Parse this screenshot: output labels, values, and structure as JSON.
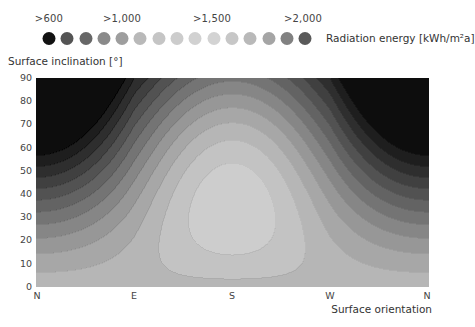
{
  "legend": {
    "title": "Radiation energy [kWh/m²a]",
    "labels": [
      {
        "text": ">600",
        "x": 49
      },
      {
        "text": ">1,000",
        "x": 122
      },
      {
        "text": ">1,500",
        "x": 212
      },
      {
        "text": ">2,000",
        "x": 303
      }
    ],
    "dots": [
      {
        "value": 600,
        "color": "#121212",
        "x": 49
      },
      {
        "value": 700,
        "color": "#545454",
        "x": 67
      },
      {
        "value": 800,
        "color": "#676767",
        "x": 86
      },
      {
        "value": 900,
        "color": "#8a8a8a",
        "x": 104
      },
      {
        "value": 1000,
        "color": "#9e9e9e",
        "x": 122
      },
      {
        "value": 1100,
        "color": "#b9b9b9",
        "x": 140
      },
      {
        "value": 1200,
        "color": "#c5c5c5",
        "x": 159
      },
      {
        "value": 1300,
        "color": "#cccccc",
        "x": 177
      },
      {
        "value": 1400,
        "color": "#d1d1d1",
        "x": 195
      },
      {
        "value": 1500,
        "color": "#d3d3d3",
        "x": 214
      },
      {
        "value": 1600,
        "color": "#c7c7c7",
        "x": 232
      },
      {
        "value": 1700,
        "color": "#b9b9b9",
        "x": 250
      },
      {
        "value": 1800,
        "color": "#a5a5a5",
        "x": 269
      },
      {
        "value": 1900,
        "color": "#818181",
        "x": 287
      },
      {
        "value": 2000,
        "color": "#5a5a5a",
        "x": 305
      }
    ]
  },
  "axes": {
    "ylabel": "Surface inclination [°]",
    "xlabel": "Surface orientation",
    "yticks": [
      {
        "text": "90",
        "y": 78
      },
      {
        "text": "80",
        "y": 101
      },
      {
        "text": "70",
        "y": 124
      },
      {
        "text": "60",
        "y": 148
      },
      {
        "text": "50",
        "y": 171
      },
      {
        "text": "40",
        "y": 194
      },
      {
        "text": "30",
        "y": 217
      },
      {
        "text": "20",
        "y": 240
      },
      {
        "text": "10",
        "y": 264
      },
      {
        "text": "0",
        "y": 287
      }
    ],
    "xticks": [
      {
        "text": "N",
        "x": 37
      },
      {
        "text": "E",
        "x": 134
      },
      {
        "text": "S",
        "x": 232
      },
      {
        "text": "W",
        "x": 330
      },
      {
        "text": "N",
        "x": 427
      }
    ]
  },
  "chart_data": {
    "type": "heatmap",
    "title": "",
    "xlabel": "Surface orientation",
    "ylabel": "Surface inclination [°]",
    "x_categories": [
      "N",
      "E",
      "S",
      "W",
      "N"
    ],
    "x_range_deg": [
      0,
      360
    ],
    "y_range": [
      0,
      90
    ],
    "y_ticks": [
      0,
      10,
      20,
      30,
      40,
      50,
      60,
      70,
      80,
      90
    ],
    "legend_title": "Radiation energy [kWh/m²a]",
    "legend_levels": [
      600,
      700,
      800,
      900,
      1000,
      1100,
      1200,
      1300,
      1400,
      1500,
      1600,
      1700,
      1800,
      1900,
      2000
    ],
    "legend_labels": [
      ">600",
      ">1,000",
      ">1,500",
      ">2,000"
    ],
    "model": {
      "horizontal_value": 1080,
      "peak_value": 1190,
      "peak_orientation_deg": 180,
      "peak_inclination_deg": 25,
      "north_vertical_value": 540,
      "description": "Annual radiation maximum near south at ~20-30° inclination; minimum on north-facing steep/vertical surfaces"
    },
    "band_levels": [
      600,
      650,
      700,
      750,
      800,
      850,
      900,
      950,
      1000,
      1050,
      1100,
      1150
    ],
    "band_colors": [
      "#0d0d0d",
      "#1e1e1e",
      "#2e2e2e",
      "#404040",
      "#525252",
      "#636363",
      "#747474",
      "#868686",
      "#979797",
      "#a7a7a7",
      "#b6b6b6",
      "#c3c3c3",
      "#cdcdcd"
    ],
    "grid": false
  }
}
